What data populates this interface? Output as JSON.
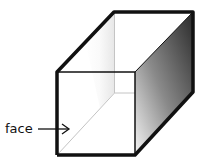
{
  "diagram": {
    "labels": {
      "face": "face"
    },
    "colors": {
      "edge": "#111111",
      "hidden_edge": "#bbbbbb",
      "side_dark": "#333333",
      "side_light": "#f2f2f2",
      "background": "#ffffff"
    }
  }
}
